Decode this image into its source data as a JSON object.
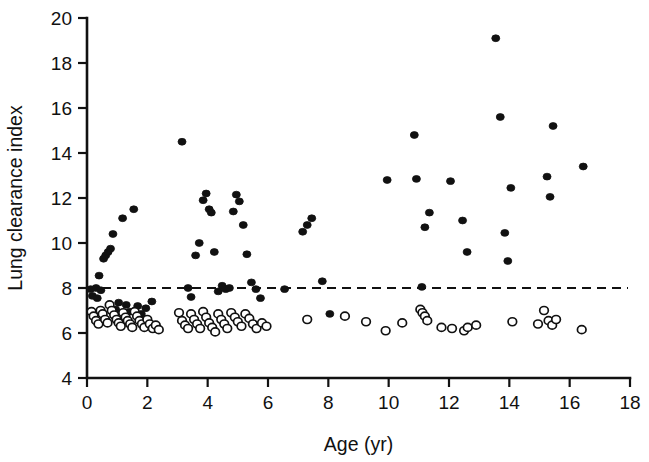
{
  "chart_data": {
    "type": "scatter",
    "title": "",
    "xlabel": "Age (yr)",
    "ylabel": "Lung clearance index",
    "xlim": [
      0,
      18
    ],
    "ylim": [
      4,
      20
    ],
    "xticks": [
      0,
      2,
      4,
      6,
      8,
      10,
      12,
      14,
      16,
      18
    ],
    "yticks": [
      4,
      6,
      8,
      10,
      12,
      14,
      16,
      18,
      20
    ],
    "xtick_labels": [
      "0",
      "2",
      "4",
      "6",
      "8",
      "10",
      "12",
      "14",
      "16",
      "18"
    ],
    "ytick_labels": [
      "4",
      "6",
      "8",
      "10",
      "12",
      "14",
      "16",
      "18",
      "20"
    ],
    "grid": false,
    "legend": "none",
    "annotations": [
      {
        "name": "upper-limit-of-normal",
        "type": "horizontal-dashed-line",
        "y": 8.0,
        "style": "dashed",
        "color": "#111111"
      }
    ],
    "series": [
      {
        "name": "abnormal-filled-circles",
        "marker": "filled-circle",
        "color": "#111111",
        "points": [
          [
            0.12,
            7.95
          ],
          [
            0.18,
            7.65
          ],
          [
            0.3,
            8.0
          ],
          [
            0.34,
            7.55
          ],
          [
            0.4,
            8.55
          ],
          [
            0.46,
            7.9
          ],
          [
            0.55,
            9.3
          ],
          [
            0.62,
            9.45
          ],
          [
            0.7,
            9.6
          ],
          [
            0.78,
            9.75
          ],
          [
            0.86,
            10.4
          ],
          [
            0.95,
            7.05
          ],
          [
            1.05,
            7.35
          ],
          [
            1.18,
            11.1
          ],
          [
            1.3,
            7.25
          ],
          [
            1.42,
            6.95
          ],
          [
            1.55,
            11.5
          ],
          [
            1.68,
            7.2
          ],
          [
            1.8,
            6.85
          ],
          [
            1.95,
            7.1
          ],
          [
            2.15,
            7.4
          ],
          [
            3.15,
            14.5
          ],
          [
            3.35,
            8.0
          ],
          [
            3.45,
            7.6
          ],
          [
            3.6,
            9.45
          ],
          [
            3.72,
            10.0
          ],
          [
            3.85,
            11.9
          ],
          [
            3.95,
            12.2
          ],
          [
            4.05,
            11.5
          ],
          [
            4.12,
            11.35
          ],
          [
            4.22,
            9.6
          ],
          [
            4.35,
            7.85
          ],
          [
            4.48,
            8.1
          ],
          [
            4.6,
            7.95
          ],
          [
            4.72,
            8.0
          ],
          [
            4.85,
            11.4
          ],
          [
            4.95,
            12.15
          ],
          [
            5.05,
            11.85
          ],
          [
            5.18,
            10.8
          ],
          [
            5.3,
            9.5
          ],
          [
            5.45,
            8.25
          ],
          [
            5.6,
            7.95
          ],
          [
            5.75,
            7.55
          ],
          [
            6.55,
            7.95
          ],
          [
            7.15,
            10.5
          ],
          [
            7.3,
            10.8
          ],
          [
            7.45,
            11.1
          ],
          [
            7.8,
            8.3
          ],
          [
            8.05,
            6.85
          ],
          [
            9.95,
            12.8
          ],
          [
            10.85,
            14.8
          ],
          [
            10.92,
            12.85
          ],
          [
            11.1,
            8.05
          ],
          [
            11.2,
            10.7
          ],
          [
            11.35,
            11.35
          ],
          [
            12.05,
            12.75
          ],
          [
            12.45,
            11.0
          ],
          [
            12.6,
            9.6
          ],
          [
            13.55,
            19.1
          ],
          [
            13.7,
            15.6
          ],
          [
            13.85,
            10.45
          ],
          [
            13.95,
            9.2
          ],
          [
            14.05,
            12.45
          ],
          [
            15.25,
            12.95
          ],
          [
            15.35,
            12.05
          ],
          [
            15.45,
            15.2
          ],
          [
            16.45,
            13.4
          ]
        ]
      },
      {
        "name": "normal-open-circles",
        "marker": "open-circle",
        "color": "#111111",
        "points": [
          [
            0.15,
            6.95
          ],
          [
            0.22,
            6.75
          ],
          [
            0.3,
            6.55
          ],
          [
            0.38,
            6.4
          ],
          [
            0.45,
            7.0
          ],
          [
            0.52,
            6.85
          ],
          [
            0.6,
            6.6
          ],
          [
            0.68,
            6.45
          ],
          [
            0.75,
            7.25
          ],
          [
            0.82,
            7.0
          ],
          [
            0.9,
            6.8
          ],
          [
            0.98,
            6.6
          ],
          [
            1.05,
            6.45
          ],
          [
            1.12,
            6.3
          ],
          [
            1.2,
            6.9
          ],
          [
            1.28,
            6.7
          ],
          [
            1.35,
            6.55
          ],
          [
            1.43,
            6.4
          ],
          [
            1.5,
            6.25
          ],
          [
            1.58,
            6.95
          ],
          [
            1.66,
            6.75
          ],
          [
            1.74,
            6.55
          ],
          [
            1.82,
            6.4
          ],
          [
            1.9,
            6.25
          ],
          [
            2.0,
            6.6
          ],
          [
            2.08,
            6.4
          ],
          [
            2.18,
            6.2
          ],
          [
            2.28,
            6.35
          ],
          [
            2.38,
            6.15
          ],
          [
            3.05,
            6.9
          ],
          [
            3.15,
            6.55
          ],
          [
            3.25,
            6.35
          ],
          [
            3.35,
            6.2
          ],
          [
            3.45,
            6.85
          ],
          [
            3.55,
            6.6
          ],
          [
            3.65,
            6.4
          ],
          [
            3.75,
            6.2
          ],
          [
            3.85,
            6.95
          ],
          [
            3.95,
            6.7
          ],
          [
            4.05,
            6.45
          ],
          [
            4.15,
            6.25
          ],
          [
            4.25,
            6.05
          ],
          [
            4.35,
            6.85
          ],
          [
            4.45,
            6.6
          ],
          [
            4.55,
            6.4
          ],
          [
            4.65,
            6.2
          ],
          [
            4.78,
            6.9
          ],
          [
            4.9,
            6.7
          ],
          [
            5.0,
            6.5
          ],
          [
            5.12,
            6.3
          ],
          [
            5.25,
            6.85
          ],
          [
            5.38,
            6.65
          ],
          [
            5.5,
            6.4
          ],
          [
            5.62,
            6.2
          ],
          [
            5.8,
            6.45
          ],
          [
            5.95,
            6.3
          ],
          [
            7.3,
            6.6
          ],
          [
            8.55,
            6.75
          ],
          [
            9.25,
            6.5
          ],
          [
            9.9,
            6.1
          ],
          [
            10.45,
            6.45
          ],
          [
            11.05,
            7.05
          ],
          [
            11.12,
            6.9
          ],
          [
            11.2,
            6.75
          ],
          [
            11.28,
            6.55
          ],
          [
            11.75,
            6.25
          ],
          [
            12.1,
            6.2
          ],
          [
            12.5,
            6.1
          ],
          [
            12.62,
            6.25
          ],
          [
            12.9,
            6.35
          ],
          [
            14.1,
            6.5
          ],
          [
            14.95,
            6.4
          ],
          [
            15.15,
            7.0
          ],
          [
            15.3,
            6.55
          ],
          [
            15.42,
            6.35
          ],
          [
            15.55,
            6.6
          ],
          [
            16.4,
            6.15
          ]
        ]
      }
    ]
  },
  "axes": {
    "x_title": "Age (yr)",
    "y_title": "Lung clearance index"
  }
}
